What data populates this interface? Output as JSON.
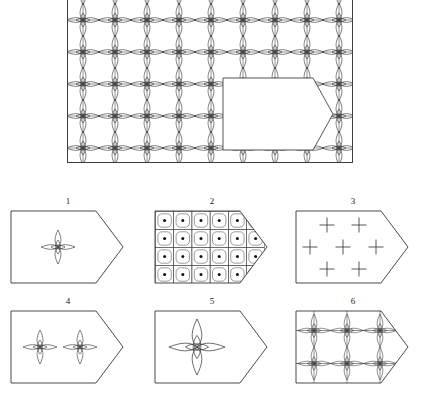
{
  "figure": {
    "type": "technical-line-drawing",
    "stroke_color": "#262626",
    "background_color": "#ffffff"
  },
  "main_pattern": {
    "name": "star-lattice-field",
    "frame": {
      "x": 0,
      "y": 0,
      "width": 286,
      "height": 189
    },
    "grid": {
      "columns": 9,
      "rows": 7,
      "cell_size": 32
    },
    "motif": "four-pointed-star",
    "cutout": {
      "name": "pentagon-cutout",
      "shape": "pentagon-arrow",
      "fill": "#ffffff",
      "x": 156,
      "y": 104,
      "width": 110,
      "height": 72
    }
  },
  "panels": [
    {
      "number": "1",
      "name": "panel-single-star",
      "content": "single four-pointed star centered",
      "motif": "four-pointed-star",
      "count": 1
    },
    {
      "number": "2",
      "name": "panel-dotted-grid",
      "content": "grid of rounded squares each with a centered dot",
      "motif": "rounded-square-with-dot",
      "columns": 6,
      "rows": 4,
      "count": 24
    },
    {
      "number": "3",
      "name": "panel-plus-signs",
      "content": "seven plus signs in staggered rows of 2-3-2",
      "motif": "plus-sign",
      "count": 7
    },
    {
      "number": "4",
      "name": "panel-two-stars",
      "content": "two four-pointed stars side by side",
      "motif": "four-pointed-star",
      "count": 2
    },
    {
      "number": "5",
      "name": "panel-large-star",
      "content": "one enlarged four-pointed star centered",
      "motif": "four-pointed-star",
      "count": 1
    },
    {
      "number": "6",
      "name": "panel-star-lattice",
      "content": "three by two lattice of four-pointed stars with connecting grid lines",
      "motif": "four-pointed-star",
      "columns": 3,
      "rows": 2,
      "count": 6
    }
  ]
}
